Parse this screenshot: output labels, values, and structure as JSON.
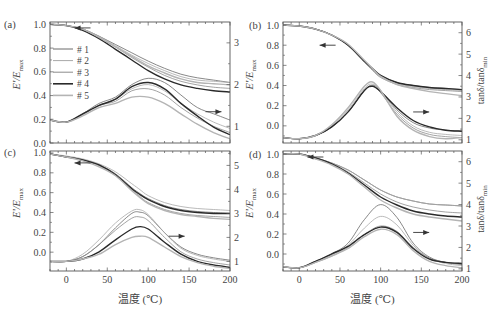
{
  "figure": {
    "x_axis_title": "温度 (℃)",
    "left_axis_title": "E'/E",
    "left_axis_sub": "max",
    "right_axis_title": "tanδ/tanδ",
    "right_axis_sub": "min"
  },
  "legend": [
    {
      "label": "# 1",
      "color": "#6a6a6a",
      "width": 0.8
    },
    {
      "label": "# 2",
      "color": "#a8a8a8",
      "width": 0.8
    },
    {
      "label": "# 3",
      "color": "#8c8c8c",
      "width": 0.8
    },
    {
      "label": "# 4",
      "color": "#2a2a2a",
      "width": 1.4
    },
    {
      "label": "# 5",
      "color": "#b4b4b4",
      "width": 1.4
    }
  ],
  "chart_data": [
    {
      "type": "line",
      "panel": "(a)",
      "xlabel": "",
      "ylabel": "E'/Emax",
      "y2label": "",
      "xlim": [
        -20,
        200
      ],
      "ylim": [
        0.0,
        1.02
      ],
      "y2lim": [
        0.6,
        3.5
      ],
      "xticks": [
        0,
        50,
        100,
        150,
        200
      ],
      "yticks": [
        0.0,
        0.2,
        0.4,
        0.6,
        0.8,
        1.0
      ],
      "y2ticks": [
        1,
        2,
        3
      ],
      "show_xtick_labels": false,
      "legend_position": "upper-left inside",
      "arrows": [
        {
          "x": 10,
          "y": 0.97,
          "dir": "left",
          "axis": "left"
        },
        {
          "x": 170,
          "y": 1.35,
          "dir": "right",
          "axis": "right"
        }
      ],
      "x": [
        -20,
        0,
        20,
        40,
        60,
        80,
        100,
        120,
        140,
        160,
        180,
        200
      ],
      "series_E": [
        {
          "name": "# 1",
          "values": [
            1.0,
            0.99,
            0.96,
            0.9,
            0.83,
            0.76,
            0.69,
            0.63,
            0.58,
            0.55,
            0.53,
            0.51
          ]
        },
        {
          "name": "# 2",
          "values": [
            1.0,
            0.99,
            0.96,
            0.9,
            0.82,
            0.74,
            0.67,
            0.61,
            0.56,
            0.53,
            0.52,
            0.51
          ]
        },
        {
          "name": "# 3",
          "values": [
            1.0,
            0.99,
            0.96,
            0.89,
            0.81,
            0.72,
            0.64,
            0.57,
            0.52,
            0.49,
            0.47,
            0.46
          ]
        },
        {
          "name": "# 4",
          "values": [
            1.0,
            0.99,
            0.95,
            0.88,
            0.79,
            0.7,
            0.61,
            0.54,
            0.49,
            0.46,
            0.44,
            0.43
          ]
        },
        {
          "name": "# 5",
          "values": [
            1.0,
            0.99,
            0.96,
            0.89,
            0.81,
            0.73,
            0.65,
            0.59,
            0.54,
            0.51,
            0.5,
            0.49
          ]
        }
      ],
      "series_tan": [
        {
          "name": "# 1",
          "values": [
            1.15,
            1.1,
            1.3,
            1.55,
            1.7,
            2.0,
            2.15,
            2.05,
            1.75,
            1.45,
            1.3,
            1.15
          ]
        },
        {
          "name": "# 2",
          "values": [
            1.15,
            1.1,
            1.28,
            1.5,
            1.65,
            1.9,
            2.0,
            1.85,
            1.55,
            1.3,
            1.1,
            0.95
          ]
        },
        {
          "name": "# 3",
          "values": [
            1.15,
            1.1,
            1.28,
            1.5,
            1.6,
            1.85,
            1.9,
            1.75,
            1.45,
            1.2,
            1.0,
            0.85
          ]
        },
        {
          "name": "# 4",
          "values": [
            1.15,
            1.1,
            1.3,
            1.5,
            1.65,
            1.95,
            2.05,
            1.9,
            1.55,
            1.25,
            0.98,
            0.8
          ]
        },
        {
          "name": "# 5",
          "values": [
            1.15,
            1.1,
            1.25,
            1.45,
            1.55,
            1.7,
            1.7,
            1.55,
            1.3,
            1.05,
            0.85,
            0.7
          ]
        }
      ]
    },
    {
      "type": "line",
      "panel": "(b)",
      "xlabel": "",
      "ylabel": "E'/Emax",
      "y2label": "tanδ/tanδmin",
      "xlim": [
        -20,
        200
      ],
      "ylim": [
        -0.17,
        1.03
      ],
      "y2lim": [
        0.85,
        6.5
      ],
      "xticks": [
        0,
        50,
        100,
        150,
        200
      ],
      "yticks": [
        0.0,
        0.2,
        0.4,
        0.6,
        0.8,
        1.0
      ],
      "y2ticks": [
        1,
        2,
        3,
        4,
        5,
        6
      ],
      "show_xtick_labels": false,
      "arrows": [
        {
          "x": 25,
          "y": 0.8,
          "dir": "left",
          "axis": "left"
        },
        {
          "x": 140,
          "y": 2.3,
          "dir": "right",
          "axis": "right"
        }
      ],
      "x": [
        -20,
        0,
        20,
        40,
        60,
        80,
        90,
        100,
        120,
        140,
        160,
        180,
        200
      ],
      "series_E": [
        {
          "name": "# 1",
          "values": [
            1.0,
            0.99,
            0.96,
            0.9,
            0.8,
            0.64,
            0.57,
            0.5,
            0.43,
            0.4,
            0.38,
            0.37,
            0.36
          ]
        },
        {
          "name": "# 2",
          "values": [
            1.0,
            0.99,
            0.96,
            0.9,
            0.8,
            0.64,
            0.56,
            0.49,
            0.42,
            0.39,
            0.37,
            0.36,
            0.35
          ]
        },
        {
          "name": "# 3",
          "values": [
            1.0,
            0.99,
            0.96,
            0.9,
            0.8,
            0.63,
            0.55,
            0.48,
            0.41,
            0.38,
            0.36,
            0.35,
            0.34
          ]
        },
        {
          "name": "# 4",
          "values": [
            1.0,
            0.99,
            0.96,
            0.9,
            0.8,
            0.64,
            0.57,
            0.5,
            0.43,
            0.4,
            0.38,
            0.37,
            0.36
          ]
        },
        {
          "name": "# 5",
          "values": [
            1.0,
            0.99,
            0.96,
            0.9,
            0.81,
            0.65,
            0.57,
            0.49,
            0.41,
            0.37,
            0.34,
            0.32,
            0.3
          ]
        }
      ],
      "series_tan": [
        {
          "name": "# 1",
          "values": [
            1.1,
            1.05,
            1.2,
            1.6,
            2.3,
            3.3,
            3.55,
            3.3,
            2.4,
            1.8,
            1.55,
            1.45,
            1.4
          ]
        },
        {
          "name": "# 2",
          "values": [
            1.1,
            1.05,
            1.2,
            1.65,
            2.4,
            3.4,
            3.6,
            3.3,
            2.3,
            1.65,
            1.35,
            1.25,
            1.2
          ]
        },
        {
          "name": "# 3",
          "values": [
            1.1,
            1.05,
            1.2,
            1.6,
            2.3,
            3.3,
            3.5,
            3.2,
            2.2,
            1.55,
            1.25,
            1.15,
            1.1
          ]
        },
        {
          "name": "# 4",
          "values": [
            1.1,
            1.05,
            1.2,
            1.6,
            2.3,
            3.3,
            3.5,
            3.25,
            2.5,
            1.9,
            1.6,
            1.45,
            1.4
          ]
        },
        {
          "name": "# 5",
          "values": [
            1.1,
            1.05,
            1.2,
            1.7,
            2.5,
            3.5,
            3.7,
            3.3,
            2.1,
            1.45,
            1.15,
            1.05,
            1.1
          ]
        }
      ]
    },
    {
      "type": "line",
      "panel": "(c)",
      "xlabel": "温度 (℃)",
      "ylabel": "E'/Emax",
      "y2label": "",
      "xlim": [
        -20,
        200
      ],
      "ylim": [
        -0.19,
        1.02
      ],
      "y2lim": [
        0.6,
        5.6
      ],
      "xticks": [
        0,
        50,
        100,
        150,
        200
      ],
      "yticks": [
        0.0,
        0.2,
        0.4,
        0.6,
        0.8,
        1.0
      ],
      "y2ticks": [
        1,
        2,
        3,
        4,
        5
      ],
      "show_xtick_labels": true,
      "arrows": [
        {
          "x": 10,
          "y": 0.9,
          "dir": "left",
          "axis": "left"
        },
        {
          "x": 125,
          "y": 2.05,
          "dir": "right",
          "axis": "right"
        }
      ],
      "x": [
        -20,
        0,
        20,
        40,
        60,
        80,
        90,
        100,
        120,
        140,
        160,
        180,
        200
      ],
      "series_E": [
        {
          "name": "# 1",
          "values": [
            0.99,
            0.96,
            0.93,
            0.88,
            0.79,
            0.65,
            0.59,
            0.54,
            0.47,
            0.43,
            0.41,
            0.4,
            0.39
          ]
        },
        {
          "name": "# 2",
          "values": [
            0.99,
            0.97,
            0.94,
            0.89,
            0.81,
            0.69,
            0.63,
            0.57,
            0.5,
            0.46,
            0.44,
            0.43,
            0.42
          ]
        },
        {
          "name": "# 3",
          "values": [
            0.99,
            0.96,
            0.93,
            0.87,
            0.78,
            0.63,
            0.56,
            0.5,
            0.43,
            0.39,
            0.37,
            0.36,
            0.35
          ]
        },
        {
          "name": "# 4",
          "values": [
            0.99,
            0.96,
            0.93,
            0.88,
            0.78,
            0.64,
            0.58,
            0.53,
            0.46,
            0.42,
            0.4,
            0.39,
            0.39
          ]
        },
        {
          "name": "# 5",
          "values": [
            0.99,
            0.96,
            0.92,
            0.86,
            0.77,
            0.62,
            0.55,
            0.49,
            0.42,
            0.38,
            0.36,
            0.34,
            0.33
          ]
        }
      ],
      "series_tan": [
        {
          "name": "# 1",
          "values": [
            1.0,
            1.0,
            1.2,
            1.7,
            2.4,
            3.0,
            3.05,
            2.9,
            2.2,
            1.6,
            1.3,
            1.15,
            1.05
          ]
        },
        {
          "name": "# 2",
          "values": [
            1.0,
            1.0,
            1.3,
            1.9,
            2.6,
            3.1,
            3.15,
            2.95,
            2.2,
            1.55,
            1.25,
            1.1,
            1.0
          ]
        },
        {
          "name": "# 3",
          "values": [
            1.0,
            1.0,
            1.2,
            1.7,
            2.3,
            2.8,
            2.85,
            2.7,
            2.0,
            1.4,
            1.1,
            0.95,
            0.85
          ]
        },
        {
          "name": "# 4",
          "values": [
            1.0,
            1.0,
            1.1,
            1.4,
            1.9,
            2.35,
            2.45,
            2.35,
            1.8,
            1.3,
            1.0,
            0.85,
            0.75
          ]
        },
        {
          "name": "# 5",
          "values": [
            1.0,
            1.0,
            1.1,
            1.3,
            1.7,
            2.0,
            2.05,
            2.0,
            1.6,
            1.2,
            0.95,
            0.8,
            0.7
          ]
        }
      ]
    },
    {
      "type": "line",
      "panel": "(d)",
      "xlabel": "温度 (℃)",
      "ylabel": "E'/Emax",
      "y2label": "tanδ/tanδmin",
      "xlim": [
        -20,
        200
      ],
      "ylim": [
        -0.17,
        1.03
      ],
      "y2lim": [
        0.9,
        6.5
      ],
      "xticks": [
        0,
        50,
        100,
        150,
        200
      ],
      "yticks": [
        0.0,
        0.2,
        0.4,
        0.6,
        0.8,
        1.0
      ],
      "y2ticks": [
        1,
        2,
        3,
        4,
        5,
        6
      ],
      "show_xtick_labels": true,
      "arrows": [
        {
          "x": 10,
          "y": 0.97,
          "dir": "left",
          "axis": "left"
        },
        {
          "x": 140,
          "y": 2.7,
          "dir": "right",
          "axis": "right"
        }
      ],
      "x": [
        -20,
        0,
        20,
        40,
        60,
        80,
        100,
        120,
        140,
        160,
        180,
        200
      ],
      "series_E": [
        {
          "name": "# 1",
          "values": [
            1.0,
            1.0,
            0.96,
            0.91,
            0.84,
            0.74,
            0.64,
            0.57,
            0.53,
            0.5,
            0.49,
            0.48
          ]
        },
        {
          "name": "# 2",
          "values": [
            1.0,
            1.0,
            0.96,
            0.91,
            0.84,
            0.74,
            0.64,
            0.57,
            0.53,
            0.5,
            0.49,
            0.48
          ]
        },
        {
          "name": "# 3",
          "values": [
            1.0,
            1.0,
            0.96,
            0.9,
            0.82,
            0.71,
            0.6,
            0.52,
            0.47,
            0.44,
            0.42,
            0.41
          ]
        },
        {
          "name": "# 4",
          "values": [
            1.0,
            1.0,
            0.96,
            0.9,
            0.81,
            0.69,
            0.57,
            0.49,
            0.43,
            0.4,
            0.38,
            0.37
          ]
        },
        {
          "name": "# 5",
          "values": [
            1.0,
            1.0,
            0.95,
            0.89,
            0.8,
            0.67,
            0.54,
            0.46,
            0.4,
            0.37,
            0.35,
            0.33
          ]
        }
      ],
      "series_tan": [
        {
          "name": "# 1",
          "values": [
            1.1,
            1.05,
            1.35,
            1.7,
            2.2,
            3.3,
            4.0,
            3.4,
            2.2,
            1.55,
            1.3,
            1.2
          ]
        },
        {
          "name": "# 2",
          "values": [
            1.1,
            1.05,
            1.3,
            1.65,
            2.1,
            2.9,
            3.45,
            3.05,
            2.1,
            1.5,
            1.25,
            1.15
          ]
        },
        {
          "name": "# 3",
          "values": [
            1.1,
            1.05,
            1.3,
            1.6,
            2.0,
            2.6,
            3.0,
            2.75,
            2.0,
            1.5,
            1.3,
            1.25
          ]
        },
        {
          "name": "# 4",
          "values": [
            1.1,
            1.05,
            1.35,
            1.7,
            2.05,
            2.6,
            2.95,
            2.7,
            1.95,
            1.45,
            1.3,
            1.25
          ]
        },
        {
          "name": "# 5",
          "values": [
            1.1,
            1.05,
            1.3,
            1.6,
            1.95,
            2.5,
            2.85,
            2.6,
            1.85,
            1.35,
            1.15,
            1.05
          ]
        }
      ]
    }
  ]
}
